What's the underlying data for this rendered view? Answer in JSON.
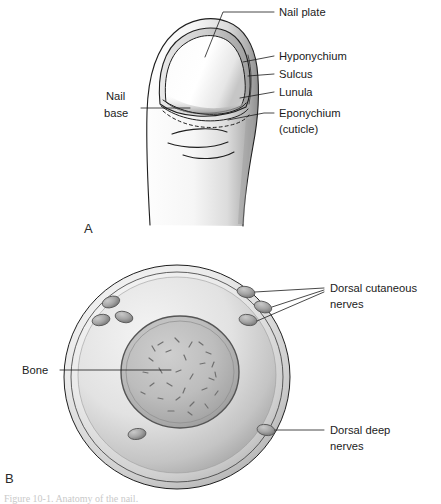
{
  "figure": {
    "panels": [
      {
        "letter": "A",
        "name": "dorsal-nail-view",
        "description": "Dorsal view of fingertip and nail"
      },
      {
        "letter": "B",
        "name": "cross-section-view",
        "description": "Cross-section of distal phalanx showing nerves and bone"
      }
    ]
  },
  "panel_a": {
    "letter": "A",
    "labels": [
      {
        "id": "nail-plate",
        "text": "Nail plate",
        "x": 279,
        "y": 22
      },
      {
        "id": "hyponychium",
        "text": "Hyponychium",
        "x": 279,
        "y": 60
      },
      {
        "id": "sulcus",
        "text": "Sulcus",
        "x": 279,
        "y": 78
      },
      {
        "id": "lunula",
        "text": "Lunula",
        "x": 279,
        "y": 96
      },
      {
        "id": "eponychium",
        "text": "Eponychium",
        "x": 279,
        "y": 117
      },
      {
        "id": "eponychium-sub",
        "text": "(cuticle)",
        "x": 279,
        "y": 133
      },
      {
        "id": "nail-base-line1",
        "text": "Nail",
        "x": 106,
        "y": 100
      },
      {
        "id": "nail-base-line2",
        "text": "base",
        "x": 104,
        "y": 117
      }
    ]
  },
  "panel_b": {
    "letter": "B",
    "labels": [
      {
        "id": "dorsal-cutaneous-nerves-line1",
        "text": "Dorsal cutaneous",
        "x": 330,
        "y": 292
      },
      {
        "id": "dorsal-cutaneous-nerves-line2",
        "text": "nerves",
        "x": 330,
        "y": 308
      },
      {
        "id": "bone",
        "text": "Bone",
        "x": 22,
        "y": 374
      },
      {
        "id": "dorsal-deep-nerves-line1",
        "text": "Dorsal deep",
        "x": 330,
        "y": 434
      },
      {
        "id": "dorsal-deep-nerves-line2",
        "text": "nerves",
        "x": 330,
        "y": 450
      }
    ],
    "structures": [
      {
        "id": "skin-rim",
        "label": "outer skin rim"
      },
      {
        "id": "soft-tissue",
        "label": "soft tissue zone"
      },
      {
        "id": "bone-core",
        "label": "distal phalanx bone"
      }
    ],
    "nerve_count_cutaneous": 6,
    "nerve_count_deep": 2
  },
  "colors": {
    "ink": "#1f1f1f",
    "text": "#1b1b1b",
    "paper": "#ffffff",
    "skin_light": "#f2f2f2",
    "skin_mid": "#d8d8d8",
    "skin_shadow": "#9a9a9a",
    "bone_fill": "#b9b9b9",
    "nerve_fill": "#a6a6a6"
  }
}
